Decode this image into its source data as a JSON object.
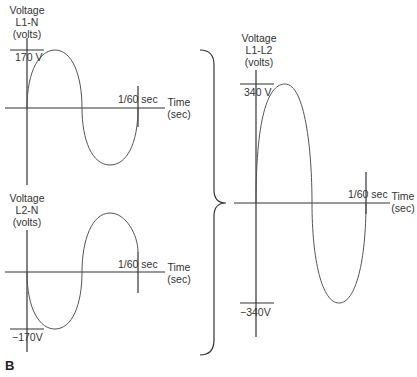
{
  "figure_label": "B",
  "plot_l1n": {
    "ylabel": [
      "Voltage",
      "L1-N",
      "(volts)"
    ],
    "peak_label": "170 V",
    "period_label": "1/60 sec",
    "xlabel": [
      "Time",
      "(sec)"
    ]
  },
  "plot_l2n": {
    "ylabel": [
      "Voltage",
      "L2-N",
      "(volts)"
    ],
    "trough_label": "−170V",
    "period_label": "1/60 sec",
    "xlabel": [
      "Time",
      "(sec)"
    ]
  },
  "plot_l1l2": {
    "ylabel": [
      "Voltage",
      "L1-L2",
      "(volts)"
    ],
    "peak_label": "340 V",
    "trough_label": "−340V",
    "period_label": "1/60 sec",
    "xlabel": [
      "Time",
      "(sec)"
    ]
  },
  "colors": {
    "line": "#555555",
    "axis": "#333333"
  }
}
